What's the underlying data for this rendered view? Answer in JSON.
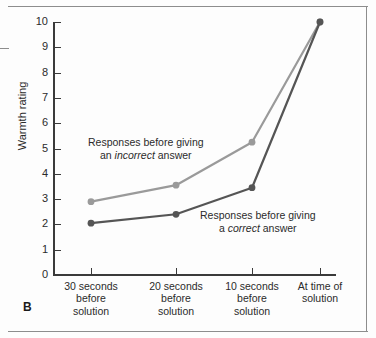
{
  "panel": {
    "label": "B"
  },
  "chart_data": {
    "type": "line",
    "title": "",
    "xlabel": "",
    "ylabel": "Warmth rating",
    "ylim": [
      0,
      10
    ],
    "ytick_labels": [
      "0",
      "1",
      "2",
      "3",
      "4",
      "5",
      "6",
      "7",
      "8",
      "9",
      "10"
    ],
    "grid": false,
    "legend": "inline-annotations",
    "categories": [
      "30 seconds\nbefore\nsolution",
      "20 seconds\nbefore\nsolution",
      "10 seconds\nbefore\nsolution",
      "At time of\nsolution"
    ],
    "category_lines": [
      [
        "30 seconds",
        "before",
        "solution"
      ],
      [
        "20 seconds",
        "before",
        "solution"
      ],
      [
        "10 seconds",
        "before",
        "solution"
      ],
      [
        "At time of",
        "solution"
      ]
    ],
    "series": [
      {
        "name": "Responses before giving an incorrect answer",
        "color": "#9a9a9a",
        "values": [
          2.9,
          3.55,
          5.25,
          10
        ]
      },
      {
        "name": "Responses before giving a correct answer",
        "color": "#555555",
        "values": [
          2.05,
          2.4,
          3.45,
          10
        ]
      }
    ],
    "annotations": [
      {
        "id": "incorrect",
        "line1": "Responses before giving",
        "line2_pre": "an ",
        "line2_em": "incorrect",
        "line2_post": " answer"
      },
      {
        "id": "correct",
        "line1": "Responses before giving",
        "line2_pre": "a ",
        "line2_em": "correct",
        "line2_post": " answer"
      }
    ]
  },
  "colors": {
    "axis": "#3a3a3a",
    "frame": "#8d8d8d",
    "series_incorrect": "#9a9a9a",
    "series_correct": "#555555",
    "text": "#2b2b2b"
  }
}
